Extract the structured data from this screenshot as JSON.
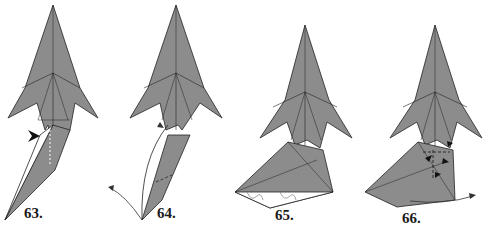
{
  "diagram": {
    "type": "origami-instructions",
    "paper_color": "#8c8c8c",
    "line_color": "#222222",
    "steps": [
      {
        "number": "63.",
        "description": "Squash/reverse fold with dashed valley line, arrow pointing in"
      },
      {
        "number": "64.",
        "description": "Swing flap out along curved arrow, dashed line"
      },
      {
        "number": "65.",
        "description": "Flap folded out, creases shown; little loops at bottom"
      },
      {
        "number": "66.",
        "description": "Multiple small fold arrows; arrow swinging right"
      }
    ]
  }
}
